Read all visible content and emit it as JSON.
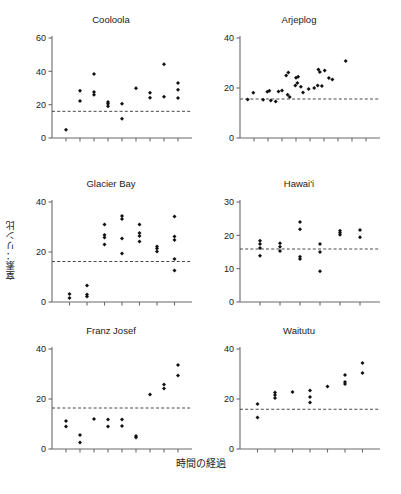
{
  "figure": {
    "ylabel": "窒素：リン比",
    "xlabel": "時間の経過",
    "caption_fragment": "",
    "marker_color": "#111111",
    "axis_color": "#6b6b6b",
    "refline_color": "#4a4a4a"
  },
  "chart_data": [
    {
      "type": "scatter",
      "title": "Cooloola",
      "xlabel": "",
      "ylabel": "窒素：リン比",
      "ylim": [
        0,
        60
      ],
      "yticks": [
        0,
        20,
        40,
        60
      ],
      "xlim": [
        0,
        10
      ],
      "xticks": [
        1,
        2,
        3,
        4,
        5,
        6,
        7,
        8,
        9
      ],
      "grid": false,
      "reference_line": 16,
      "points": [
        {
          "x": 1,
          "y": 5
        },
        {
          "x": 2,
          "y": 28.4
        },
        {
          "x": 2,
          "y": 22.2
        },
        {
          "x": 3,
          "y": 38.4
        },
        {
          "x": 3,
          "y": 27.6
        },
        {
          "x": 3,
          "y": 26
        },
        {
          "x": 4,
          "y": 21.6
        },
        {
          "x": 4,
          "y": 20.6
        },
        {
          "x": 4,
          "y": 19
        },
        {
          "x": 5,
          "y": 20.6
        },
        {
          "x": 5,
          "y": 11.6
        },
        {
          "x": 6,
          "y": 29.8
        },
        {
          "x": 7,
          "y": 27.2
        },
        {
          "x": 7,
          "y": 24.2
        },
        {
          "x": 8,
          "y": 44.2
        },
        {
          "x": 8,
          "y": 24.8
        },
        {
          "x": 9,
          "y": 33
        },
        {
          "x": 9,
          "y": 29
        },
        {
          "x": 9,
          "y": 24
        }
      ]
    },
    {
      "type": "scatter",
      "title": "Arjeplog",
      "xlabel": "",
      "ylabel": "",
      "ylim": [
        0,
        40
      ],
      "yticks": [
        0,
        20,
        40
      ],
      "xlim": [
        0,
        10
      ],
      "xticks": [
        1,
        2,
        3,
        4,
        5,
        6,
        7,
        8,
        9
      ],
      "grid": false,
      "reference_line": 15.6,
      "points": [
        {
          "x": 0.55,
          "y": 15.4
        },
        {
          "x": 0.95,
          "y": 18.1
        },
        {
          "x": 1.65,
          "y": 15.3
        },
        {
          "x": 1.95,
          "y": 18.5
        },
        {
          "x": 2.1,
          "y": 18.9
        },
        {
          "x": 2.2,
          "y": 15.0
        },
        {
          "x": 2.55,
          "y": 14.6
        },
        {
          "x": 2.75,
          "y": 18.6
        },
        {
          "x": 3.0,
          "y": 19.0
        },
        {
          "x": 3.3,
          "y": 25.0
        },
        {
          "x": 3.45,
          "y": 26.2
        },
        {
          "x": 3.4,
          "y": 17.3
        },
        {
          "x": 3.55,
          "y": 16.4
        },
        {
          "x": 4.0,
          "y": 24.1
        },
        {
          "x": 4.15,
          "y": 24.5
        },
        {
          "x": 4.1,
          "y": 22.0
        },
        {
          "x": 3.95,
          "y": 21.0
        },
        {
          "x": 4.35,
          "y": 20.5
        },
        {
          "x": 4.5,
          "y": 18.2
        },
        {
          "x": 4.9,
          "y": 19.6
        },
        {
          "x": 5.3,
          "y": 20.0
        },
        {
          "x": 5.6,
          "y": 27.4
        },
        {
          "x": 5.7,
          "y": 26.4
        },
        {
          "x": 5.55,
          "y": 21.0
        },
        {
          "x": 5.85,
          "y": 20.8
        },
        {
          "x": 6.05,
          "y": 27.0
        },
        {
          "x": 6.35,
          "y": 24.0
        },
        {
          "x": 6.6,
          "y": 23.4
        },
        {
          "x": 7.55,
          "y": 30.8
        }
      ]
    },
    {
      "type": "scatter",
      "title": "Glacier Bay",
      "xlabel": "",
      "ylabel": "窒素：リン比",
      "ylim": [
        0,
        40
      ],
      "yticks": [
        0,
        20,
        40
      ],
      "xlim": [
        0,
        8
      ],
      "xticks": [
        1,
        2,
        3,
        4,
        5,
        6,
        7
      ],
      "grid": false,
      "reference_line": 16.2,
      "points": [
        {
          "x": 1,
          "y": 3.2
        },
        {
          "x": 1,
          "y": 1.6
        },
        {
          "x": 2,
          "y": 6.6
        },
        {
          "x": 2,
          "y": 3.0
        },
        {
          "x": 2,
          "y": 2.2
        },
        {
          "x": 3,
          "y": 31.0
        },
        {
          "x": 3,
          "y": 26.8
        },
        {
          "x": 3,
          "y": 25.8
        },
        {
          "x": 3,
          "y": 23.0
        },
        {
          "x": 4,
          "y": 34.4
        },
        {
          "x": 4,
          "y": 33.2
        },
        {
          "x": 4,
          "y": 25.4
        },
        {
          "x": 4,
          "y": 19.4
        },
        {
          "x": 5,
          "y": 31.0
        },
        {
          "x": 5,
          "y": 27.6
        },
        {
          "x": 5,
          "y": 26.4
        },
        {
          "x": 5,
          "y": 24.2
        },
        {
          "x": 6,
          "y": 22.2
        },
        {
          "x": 6,
          "y": 21.4
        },
        {
          "x": 6,
          "y": 20.2
        },
        {
          "x": 7,
          "y": 34.2
        },
        {
          "x": 7,
          "y": 26.2
        },
        {
          "x": 7,
          "y": 24.8
        },
        {
          "x": 7,
          "y": 17.2
        },
        {
          "x": 7,
          "y": 12.6
        }
      ]
    },
    {
      "type": "scatter",
      "title": "Hawai'i",
      "xlabel": "",
      "ylabel": "",
      "ylim": [
        0,
        30
      ],
      "yticks": [
        0,
        10,
        20,
        30
      ],
      "xlim": [
        0,
        7
      ],
      "xticks": [
        1,
        2,
        3,
        4,
        5,
        6
      ],
      "grid": false,
      "reference_line": 15.9,
      "points": [
        {
          "x": 1,
          "y": 18.4
        },
        {
          "x": 1,
          "y": 17.4
        },
        {
          "x": 1,
          "y": 16.2
        },
        {
          "x": 1,
          "y": 13.9
        },
        {
          "x": 2,
          "y": 17.6
        },
        {
          "x": 2,
          "y": 16.6
        },
        {
          "x": 2,
          "y": 15.3
        },
        {
          "x": 3,
          "y": 24.0
        },
        {
          "x": 3,
          "y": 21.8
        },
        {
          "x": 3,
          "y": 13.6
        },
        {
          "x": 3,
          "y": 12.9
        },
        {
          "x": 4,
          "y": 17.4
        },
        {
          "x": 4,
          "y": 15.0
        },
        {
          "x": 4,
          "y": 9.2
        },
        {
          "x": 5,
          "y": 21.4
        },
        {
          "x": 5,
          "y": 20.8
        },
        {
          "x": 5,
          "y": 20.2
        },
        {
          "x": 6,
          "y": 21.6
        },
        {
          "x": 6,
          "y": 19.4
        }
      ]
    },
    {
      "type": "scatter",
      "title": "Franz Josef",
      "xlabel": "時間の経過",
      "ylabel": "窒素：リン比",
      "ylim": [
        0,
        40
      ],
      "yticks": [
        0,
        20,
        40
      ],
      "xlim": [
        0,
        10
      ],
      "xticks": [
        1,
        2,
        3,
        4,
        5,
        6,
        7,
        8,
        9
      ],
      "grid": false,
      "reference_line": 16.4,
      "points": [
        {
          "x": 1,
          "y": 11.2
        },
        {
          "x": 1,
          "y": 9.0
        },
        {
          "x": 2,
          "y": 5.6
        },
        {
          "x": 2,
          "y": 2.6
        },
        {
          "x": 3,
          "y": 12.0
        },
        {
          "x": 4,
          "y": 11.8
        },
        {
          "x": 4,
          "y": 9.0
        },
        {
          "x": 5,
          "y": 11.8
        },
        {
          "x": 5,
          "y": 9.2
        },
        {
          "x": 6,
          "y": 5.2
        },
        {
          "x": 6,
          "y": 4.6
        },
        {
          "x": 7,
          "y": 21.8
        },
        {
          "x": 8,
          "y": 25.8
        },
        {
          "x": 8,
          "y": 24.2
        },
        {
          "x": 9,
          "y": 33.6
        },
        {
          "x": 9,
          "y": 29.4
        }
      ]
    },
    {
      "type": "scatter",
      "title": "Waitutu",
      "xlabel": "時間の経過",
      "ylabel": "",
      "ylim": [
        0,
        40
      ],
      "yticks": [
        0,
        20,
        40
      ],
      "xlim": [
        0,
        8
      ],
      "xticks": [
        1,
        2,
        3,
        4,
        5,
        6,
        7
      ],
      "grid": false,
      "reference_line": 15.9,
      "points": [
        {
          "x": 1,
          "y": 18.0
        },
        {
          "x": 1,
          "y": 12.6
        },
        {
          "x": 2,
          "y": 22.6
        },
        {
          "x": 2,
          "y": 21.6
        },
        {
          "x": 2,
          "y": 20.4
        },
        {
          "x": 3,
          "y": 22.8
        },
        {
          "x": 4,
          "y": 23.4
        },
        {
          "x": 4,
          "y": 20.8
        },
        {
          "x": 4,
          "y": 18.6
        },
        {
          "x": 5,
          "y": 25.0
        },
        {
          "x": 6,
          "y": 29.6
        },
        {
          "x": 6,
          "y": 26.8
        },
        {
          "x": 6,
          "y": 26.0
        },
        {
          "x": 7,
          "y": 34.4
        },
        {
          "x": 7,
          "y": 30.4
        }
      ]
    }
  ]
}
